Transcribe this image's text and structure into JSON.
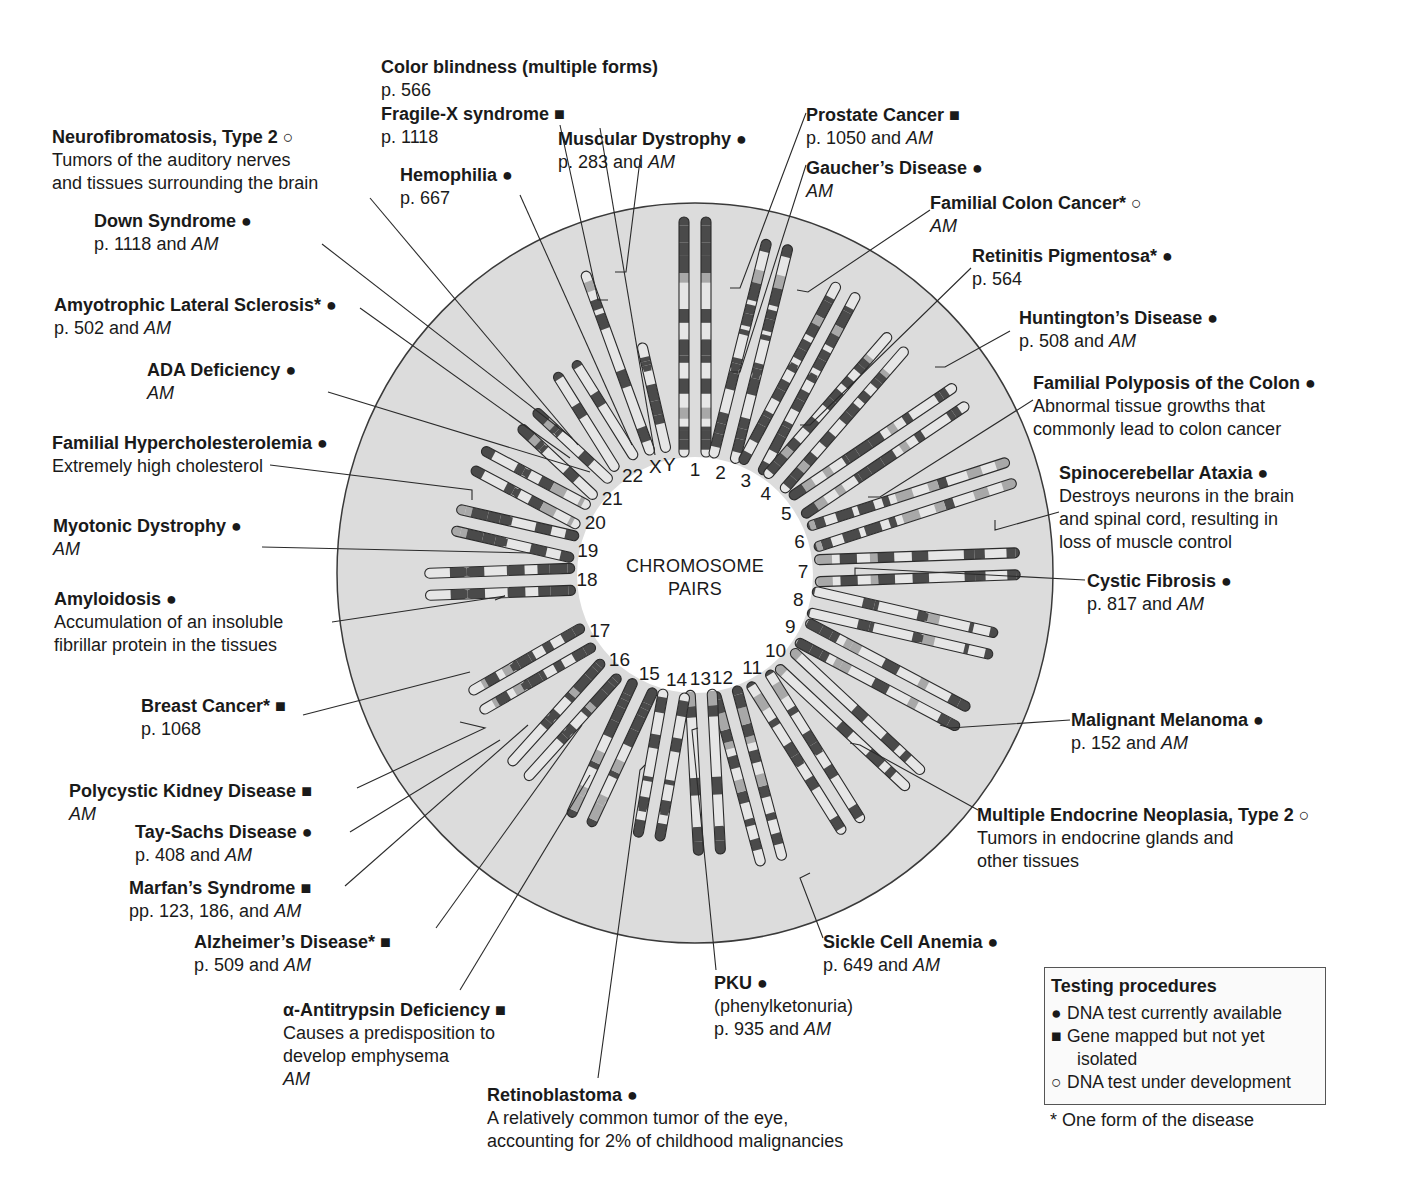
{
  "center_label": {
    "line1": "CHROMOSOME",
    "line2": "PAIRS"
  },
  "colors": {
    "circle_fill": "#dcdcdc",
    "circle_stroke": "#3a3a3a",
    "band_dark": "#4a4a4a",
    "band_light": "#e6e6e6",
    "band_mid": "#a8a8a8",
    "leader": "#2a2a2a"
  },
  "symbols": {
    "available": "●",
    "mapped": "■",
    "development": "○"
  },
  "chromosomes": [
    {
      "num": "1",
      "angle": 0,
      "r0": 118,
      "len": 240,
      "cen": 0.5,
      "pair": true
    },
    {
      "num": "2",
      "angle": 14,
      "r0": 118,
      "len": 225,
      "cen": 0.4,
      "pair": true
    },
    {
      "num": "3",
      "angle": 28,
      "r0": 120,
      "len": 205,
      "cen": 0.55,
      "pair": true
    },
    {
      "num": "4",
      "angle": 41,
      "r0": 120,
      "len": 190,
      "cen": 0.7,
      "pair": true
    },
    {
      "num": "5",
      "angle": 56,
      "r0": 122,
      "len": 200,
      "cen": 0.75,
      "pair": true
    },
    {
      "num": "6",
      "angle": 72,
      "r0": 122,
      "len": 212,
      "cen": 0.6,
      "pair": true
    },
    {
      "num": "7",
      "angle": 88,
      "r0": 120,
      "len": 205,
      "cen": 0.62,
      "pair": true
    },
    {
      "num": "8",
      "angle": 103,
      "r0": 118,
      "len": 190,
      "cen": 0.62,
      "pair": true
    },
    {
      "num": "9",
      "angle": 118,
      "r0": 120,
      "len": 185,
      "cen": 0.65,
      "pair": true
    },
    {
      "num": "10",
      "angle": 133,
      "r0": 122,
      "len": 180,
      "cen": 0.62,
      "pair": true
    },
    {
      "num": "11",
      "angle": 148,
      "r0": 120,
      "len": 178,
      "cen": 0.55,
      "pair": true
    },
    {
      "num": "12",
      "angle": 165,
      "r0": 118,
      "len": 180,
      "cen": 0.72,
      "pair": true
    },
    {
      "num": "13",
      "angle": 177,
      "r0": 115,
      "len": 165,
      "cen": 0.82,
      "pair": true
    },
    {
      "num": "14",
      "angle": 190,
      "r0": 118,
      "len": 150,
      "cen": 0.82,
      "pair": true
    },
    {
      "num": "15",
      "angle": 205,
      "r0": 120,
      "len": 152,
      "cen": 0.82,
      "pair": true
    },
    {
      "num": "16",
      "angle": 222,
      "r0": 125,
      "len": 140,
      "cen": 0.55,
      "pair": true
    },
    {
      "num": "17",
      "angle": 240,
      "r0": 122,
      "len": 132,
      "cen": 0.62,
      "pair": true
    },
    {
      "num": "18",
      "angle": 268,
      "r0": 120,
      "len": 150,
      "cen": 0.72,
      "pair": true
    },
    {
      "num": "19",
      "angle": 283,
      "r0": 122,
      "len": 125,
      "cen": 0.55,
      "pair": true
    },
    {
      "num": "20",
      "angle": 298,
      "r0": 125,
      "len": 122,
      "cen": 0.6,
      "pair": true
    },
    {
      "num": "21",
      "angle": 313,
      "r0": 125,
      "len": 105,
      "cen": 0.7,
      "pair": true
    },
    {
      "num": "22",
      "angle": 328,
      "r0": 130,
      "len": 115,
      "cen": 0.72,
      "pair": true
    },
    {
      "num": "X",
      "angle": 340,
      "r0": 128,
      "len": 195,
      "cen": 0.55,
      "pair": false
    },
    {
      "num": "Y",
      "angle": 347,
      "r0": 126,
      "len": 112,
      "cen": 0.75,
      "pair": false
    }
  ],
  "diseases": [
    {
      "id": "color-blindness",
      "title": "Color blindness (multiple forms)",
      "sym": "",
      "lines": [
        "p. 566"
      ],
      "x": 381,
      "y": 56
    },
    {
      "id": "fragile-x",
      "title": "Fragile-X syndrome",
      "sym": "■",
      "lines": [
        "p. 1118"
      ],
      "x": 381,
      "y": 103
    },
    {
      "id": "neurofibromatosis",
      "title": "Neurofibromatosis, Type 2",
      "sym": "○",
      "lines": [
        "Tumors of the auditory nerves",
        "and tissues surrounding the brain"
      ],
      "x": 52,
      "y": 126
    },
    {
      "id": "muscular-dystrophy",
      "title": "Muscular Dystrophy",
      "sym": "●",
      "lines": [
        "p. 283 and |AM"
      ],
      "x": 558,
      "y": 128
    },
    {
      "id": "hemophilia",
      "title": "Hemophilia",
      "sym": "●",
      "lines": [
        "p. 667"
      ],
      "x": 400,
      "y": 164
    },
    {
      "id": "prostate-cancer",
      "title": "Prostate Cancer",
      "sym": "■",
      "lines": [
        "p. 1050 and |AM"
      ],
      "x": 806,
      "y": 104
    },
    {
      "id": "gaucher",
      "title": "Gaucher’s Disease",
      "sym": "●",
      "lines": [
        "|AM"
      ],
      "x": 806,
      "y": 157
    },
    {
      "id": "familial-colon-cancer",
      "title": "Familial Colon Cancer*",
      "sym": "○",
      "lines": [
        "|AM"
      ],
      "x": 930,
      "y": 192
    },
    {
      "id": "down-syndrome",
      "title": "Down Syndrome",
      "sym": "●",
      "lines": [
        "p. 1118 and |AM"
      ],
      "x": 94,
      "y": 210
    },
    {
      "id": "retinitis-pigmentosa",
      "title": "Retinitis Pigmentosa*",
      "sym": "●",
      "lines": [
        "p. 564"
      ],
      "x": 972,
      "y": 245
    },
    {
      "id": "als",
      "title": "Amyotrophic Lateral Sclerosis*",
      "sym": "●",
      "lines": [
        "p. 502 and |AM"
      ],
      "x": 54,
      "y": 294
    },
    {
      "id": "huntington",
      "title": "Huntington’s Disease",
      "sym": "●",
      "lines": [
        "p. 508 and |AM"
      ],
      "x": 1019,
      "y": 307
    },
    {
      "id": "ada-deficiency",
      "title": "ADA Deficiency",
      "sym": "●",
      "lines": [
        "|AM"
      ],
      "x": 147,
      "y": 359
    },
    {
      "id": "familial-polyposis",
      "title": "Familial Polyposis of the Colon",
      "sym": "●",
      "lines": [
        "Abnormal tissue growths that",
        "commonly lead to colon cancer"
      ],
      "x": 1033,
      "y": 372
    },
    {
      "id": "hypercholesterolemia",
      "title": "Familial Hypercholesterolemia",
      "sym": "●",
      "lines": [
        "Extremely high cholesterol"
      ],
      "x": 52,
      "y": 432
    },
    {
      "id": "spinocerebellar-ataxia",
      "title": "Spinocerebellar Ataxia",
      "sym": "●",
      "lines": [
        "Destroys neurons in the brain",
        "and spinal cord, resulting in",
        "loss of muscle control"
      ],
      "x": 1059,
      "y": 462
    },
    {
      "id": "myotonic-dystrophy",
      "title": "Myotonic Dystrophy",
      "sym": "●",
      "lines": [
        "|AM"
      ],
      "x": 53,
      "y": 515
    },
    {
      "id": "cystic-fibrosis",
      "title": "Cystic Fibrosis",
      "sym": "●",
      "lines": [
        "p. 817 and |AM"
      ],
      "x": 1087,
      "y": 570
    },
    {
      "id": "amyloidosis",
      "title": "Amyloidosis",
      "sym": "●",
      "lines": [
        "Accumulation of an insoluble",
        "fibrillar protein in the tissues"
      ],
      "x": 54,
      "y": 588
    },
    {
      "id": "breast-cancer",
      "title": "Breast Cancer*",
      "sym": "■",
      "lines": [
        "p. 1068"
      ],
      "x": 141,
      "y": 695
    },
    {
      "id": "malignant-melanoma",
      "title": "Malignant Melanoma",
      "sym": "●",
      "lines": [
        "p. 152 and |AM"
      ],
      "x": 1071,
      "y": 709
    },
    {
      "id": "polycystic-kidney",
      "title": "Polycystic Kidney Disease",
      "sym": "■",
      "lines": [
        "|AM"
      ],
      "x": 69,
      "y": 780
    },
    {
      "id": "men2",
      "title": "Multiple Endocrine Neoplasia, Type 2",
      "sym": "○",
      "lines": [
        "Tumors in endocrine glands and",
        "other tissues"
      ],
      "x": 977,
      "y": 804
    },
    {
      "id": "tay-sachs",
      "title": "Tay-Sachs Disease",
      "sym": "●",
      "lines": [
        "p. 408 and |AM"
      ],
      "x": 135,
      "y": 821
    },
    {
      "id": "marfan",
      "title": "Marfan’s Syndrome",
      "sym": "■",
      "lines": [
        "pp. 123, 186, and |AM"
      ],
      "x": 129,
      "y": 877
    },
    {
      "id": "alzheimer",
      "title": "Alzheimer’s Disease*",
      "sym": "■",
      "lines": [
        "p. 509 and |AM"
      ],
      "x": 194,
      "y": 931
    },
    {
      "id": "sickle-cell",
      "title": "Sickle Cell Anemia",
      "sym": "●",
      "lines": [
        "p. 649 and |AM"
      ],
      "x": 823,
      "y": 931
    },
    {
      "id": "pku",
      "title": "PKU",
      "sym": "●",
      "lines": [
        "(phenylketonuria)",
        "p. 935 and |AM"
      ],
      "x": 714,
      "y": 972
    },
    {
      "id": "antitrypsin",
      "title": "α-Antitrypsin Deficiency",
      "sym": "■",
      "lines": [
        "Causes a predisposition to",
        "develop emphysema",
        "|AM"
      ],
      "x": 283,
      "y": 999
    },
    {
      "id": "retinoblastoma",
      "title": "Retinoblastoma",
      "sym": "●",
      "lines": [
        "A relatively common tumor of the eye,",
        "accounting for 2% of childhood malignancies"
      ],
      "x": 487,
      "y": 1084
    }
  ],
  "leaders": [
    [
      [
        560,
        125
      ],
      [
        598,
        300
      ],
      [
        608,
        300
      ]
    ],
    [
      [
        600,
        128
      ],
      [
        655,
        455
      ]
    ],
    [
      [
        370,
        198
      ],
      [
        578,
        445
      ]
    ],
    [
      [
        640,
        160
      ],
      [
        626,
        272
      ],
      [
        615,
        272
      ]
    ],
    [
      [
        520,
        195
      ],
      [
        632,
        445
      ]
    ],
    [
      [
        806,
        113
      ],
      [
        740,
        288
      ],
      [
        730,
        288
      ]
    ],
    [
      [
        806,
        165
      ],
      [
        740,
        372
      ],
      [
        730,
        372
      ]
    ],
    [
      [
        930,
        210
      ],
      [
        808,
        292
      ],
      [
        797,
        290
      ]
    ],
    [
      [
        322,
        244
      ],
      [
        572,
        438
      ]
    ],
    [
      [
        971,
        268
      ],
      [
        810,
        425
      ],
      [
        800,
        425
      ]
    ],
    [
      [
        360,
        308
      ],
      [
        570,
        458
      ]
    ],
    [
      [
        1010,
        331
      ],
      [
        945,
        367
      ],
      [
        935,
        367
      ]
    ],
    [
      [
        328,
        392
      ],
      [
        590,
        472
      ]
    ],
    [
      [
        1033,
        400
      ],
      [
        880,
        497
      ],
      [
        868,
        497
      ]
    ],
    [
      [
        270,
        465
      ],
      [
        472,
        490
      ],
      [
        472,
        500
      ]
    ],
    [
      [
        1059,
        512
      ],
      [
        995,
        530
      ],
      [
        995,
        520
      ]
    ],
    [
      [
        262,
        547
      ],
      [
        530,
        553
      ]
    ],
    [
      [
        1085,
        580
      ],
      [
        855,
        568
      ],
      [
        855,
        575
      ]
    ],
    [
      [
        332,
        622
      ],
      [
        505,
        596
      ],
      [
        495,
        600
      ]
    ],
    [
      [
        303,
        715
      ],
      [
        470,
        672
      ]
    ],
    [
      [
        1070,
        720
      ],
      [
        950,
        728
      ],
      [
        940,
        725
      ]
    ],
    [
      [
        357,
        788
      ],
      [
        485,
        728
      ],
      [
        460,
        722
      ]
    ],
    [
      [
        978,
        810
      ],
      [
        860,
        745
      ],
      [
        850,
        743
      ]
    ],
    [
      [
        350,
        832
      ],
      [
        500,
        740
      ]
    ],
    [
      [
        345,
        886
      ],
      [
        528,
        725
      ]
    ],
    [
      [
        436,
        928
      ],
      [
        582,
        725
      ]
    ],
    [
      [
        823,
        938
      ],
      [
        800,
        878
      ],
      [
        810,
        873
      ]
    ],
    [
      [
        716,
        970
      ],
      [
        692,
        730
      ],
      [
        698,
        728
      ]
    ],
    [
      [
        460,
        990
      ],
      [
        590,
        775
      ]
    ],
    [
      [
        598,
        1078
      ],
      [
        640,
        770
      ],
      [
        645,
        765
      ]
    ]
  ],
  "legend": {
    "title": "Testing procedures",
    "items": [
      {
        "sym": "●",
        "text": "DNA test currently available"
      },
      {
        "sym": "■",
        "text": "Gene mapped but not yet"
      },
      {
        "sym": "",
        "text": "isolated"
      },
      {
        "sym": "○",
        "text": "DNA test under development"
      }
    ],
    "footnote": "* One form of the disease"
  }
}
